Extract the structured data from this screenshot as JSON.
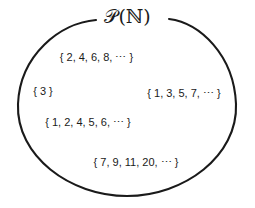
{
  "diagram": {
    "title": "𝒫(ℕ)",
    "title_icon": "power-set-of-naturals-label",
    "boundary": {
      "shape": "ellipse",
      "stroke_color": "#1a1a1a",
      "fill_color": "#ffffff",
      "has_top_gap_for_title": true
    },
    "background_color": "#ffffff",
    "text_color": "#1a1a1a",
    "elements": [
      {
        "label": "{ 2, 4, 6, 8, ⋯ }"
      },
      {
        "label": "{ 3 }"
      },
      {
        "label": "{ 1, 3, 5, 7, ⋯ }"
      },
      {
        "label": "{ 1, 2, 4, 5, 6, ⋯ }"
      },
      {
        "label": "{ 7, 9, 11, 20, ⋯ }"
      }
    ]
  }
}
